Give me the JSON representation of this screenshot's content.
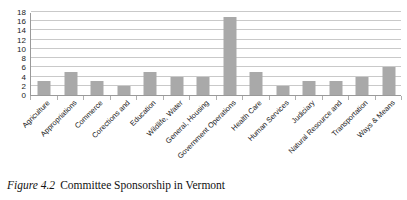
{
  "figure": {
    "caption_number": "Figure 4.2",
    "caption_title": "Committee Sponsorship in Vermont"
  },
  "colors": {
    "bar": "#a9a9a9",
    "gridline": "#c9c9c9",
    "axis": "#9a9a9a",
    "text": "#1a1a1a",
    "background": "#ffffff"
  },
  "chart_data": {
    "type": "bar",
    "title": "",
    "xlabel": "",
    "ylabel": "",
    "ylim": [
      0,
      18
    ],
    "yticks": [
      0,
      2,
      4,
      6,
      8,
      10,
      12,
      14,
      16,
      18
    ],
    "grid": true,
    "legend": false,
    "orientation": "vertical",
    "categories": [
      "Agriculture",
      "Appropriations",
      "Commerce",
      "Corections and",
      "Education",
      "Wildlife, Water",
      "General, Housing",
      "Government Operations",
      "Health Care",
      "Human Services",
      "Judiciary",
      "Natural Resource and",
      "Transportation",
      "Ways & Means"
    ],
    "values": [
      3,
      5,
      3,
      2,
      5,
      4,
      4,
      17,
      5,
      2,
      3,
      3,
      4,
      6
    ]
  }
}
